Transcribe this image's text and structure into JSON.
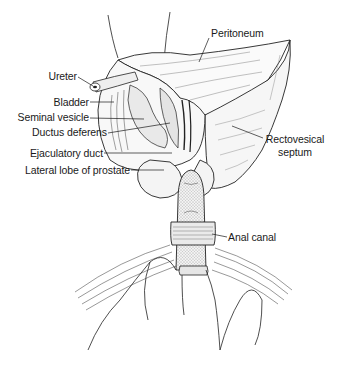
{
  "figure": {
    "type": "anatomical illustration",
    "background": "#ffffff",
    "ink_color": "#1a1a1a",
    "labels": [
      {
        "id": "peritoneum",
        "text": "Peritoneum"
      },
      {
        "id": "ureter",
        "text": "Ureter"
      },
      {
        "id": "bladder",
        "text": "Bladder"
      },
      {
        "id": "seminal_vesicle",
        "text": "Seminal vesicle"
      },
      {
        "id": "ductus_deferens",
        "text": "Ductus deferens"
      },
      {
        "id": "ejaculatory_duct",
        "text": "Ejaculatory duct"
      },
      {
        "id": "lateral_lobe",
        "text": "Lateral lobe of prostate"
      },
      {
        "id": "rectovesical_1",
        "text": "Rectovesical"
      },
      {
        "id": "rectovesical_2",
        "text": "septum"
      },
      {
        "id": "anal_canal",
        "text": "Anal canal"
      }
    ]
  }
}
